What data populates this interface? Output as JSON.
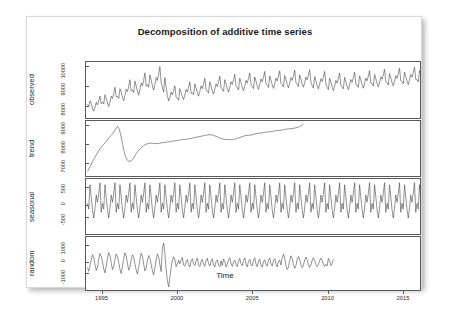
{
  "figure": {
    "title": "Decomposition of additive time series",
    "xlabel": "Time",
    "background_color": "#ffffff",
    "line_color": "#333333",
    "frame_color": "#5a5a5a"
  },
  "panels": {
    "observed": {
      "label": "observed",
      "yticks": [
        "10000",
        "9000",
        "8000"
      ]
    },
    "trend": {
      "label": "trend",
      "yticks": [
        "9000",
        "8000",
        "7000"
      ]
    },
    "seasonal": {
      "label": "seasonal",
      "yticks": [
        "500",
        "0",
        "-500"
      ]
    },
    "random": {
      "label": "random",
      "yticks": [
        "1000",
        "0",
        "-1000"
      ]
    }
  },
  "xaxis": {
    "ticks": [
      "1995",
      "2000",
      "2005",
      "2010",
      "2015"
    ],
    "range": [
      1993.9,
      2016.2
    ]
  },
  "chart_data": {
    "type": "line",
    "title": "Decomposition of additive time series",
    "xlabel": "Time",
    "ylabel": "",
    "grid": false,
    "legend": null,
    "layout": "4 stacked panels sharing one x axis (R decompose() additive model)",
    "x_start": 1994.0,
    "x_end": 2016.0,
    "frequency": 12,
    "series": [
      {
        "name": "observed",
        "panel": 1,
        "ylim": [
          7600,
          11400
        ],
        "yticks": [
          8000,
          9000,
          10000
        ],
        "values": [
          8450,
          8300,
          8700,
          8520,
          8180,
          7960,
          8250,
          8600,
          8420,
          8700,
          9050,
          8500,
          8620,
          8480,
          9150,
          8900,
          8550,
          8300,
          8620,
          9050,
          8880,
          9250,
          9700,
          9000,
          9050,
          8880,
          9600,
          9350,
          8980,
          8720,
          9100,
          9550,
          9380,
          9750,
          10250,
          9420,
          9500,
          9300,
          10150,
          9800,
          9400,
          9120,
          9520,
          10000,
          9800,
          10200,
          10750,
          9800,
          9900,
          9700,
          10600,
          10250,
          9800,
          9500,
          9900,
          10400,
          10200,
          10650,
          11200,
          10050,
          9700,
          9350,
          10400,
          9700,
          9100,
          8700,
          8950,
          9350,
          9150,
          9450,
          9800,
          8950,
          8900,
          8750,
          9600,
          9300,
          9000,
          8800,
          9150,
          9550,
          9350,
          9700,
          10100,
          9250,
          9300,
          9150,
          9950,
          9650,
          9300,
          9050,
          9400,
          9800,
          9600,
          9950,
          10350,
          9500,
          9450,
          9280,
          10100,
          9800,
          9450,
          9200,
          9550,
          9950,
          9750,
          10100,
          10500,
          9650,
          9550,
          9400,
          10250,
          9950,
          9600,
          9350,
          9700,
          10100,
          9900,
          10250,
          10650,
          9800,
          9700,
          9500,
          10350,
          10050,
          9700,
          9450,
          9800,
          10200,
          10000,
          10350,
          10750,
          9880,
          9780,
          9600,
          10450,
          10150,
          9800,
          9550,
          9900,
          10300,
          10100,
          10450,
          10850,
          9950,
          9850,
          9680,
          10520,
          10220,
          9870,
          9620,
          9960,
          10360,
          10160,
          10500,
          10900,
          10000,
          9900,
          9720,
          10560,
          10260,
          9910,
          9660,
          10000,
          10400,
          10200,
          10540,
          10940,
          10040,
          9930,
          9750,
          10600,
          10300,
          9950,
          9700,
          10040,
          10440,
          10240,
          10580,
          10980,
          10080,
          9820,
          9640,
          10480,
          10180,
          9830,
          9580,
          9920,
          10320,
          10120,
          10460,
          10860,
          9960,
          9700,
          9520,
          10360,
          10060,
          9710,
          9460,
          9800,
          10200,
          10000,
          10340,
          10740,
          9840,
          9760,
          9580,
          10420,
          10120,
          9770,
          9520,
          9860,
          10260,
          10060,
          10400,
          10800,
          9900,
          9860,
          9690,
          10530,
          10230,
          9880,
          9630,
          9970,
          10370,
          10170,
          10510,
          10910,
          10010,
          9960,
          9790,
          10630,
          10330,
          9980,
          9730,
          10070,
          10470,
          10270,
          10610,
          11010,
          10110,
          10030,
          9860,
          10700,
          10400,
          10050,
          9800,
          10140,
          10540,
          10340,
          10680,
          11080,
          10180,
          10120,
          9950,
          10790,
          10490,
          10140,
          9890,
          10230,
          10630,
          10430,
          10770,
          11170,
          10270,
          10250,
          10080,
          10920,
          10620,
          10270
        ]
      },
      {
        "name": "trend",
        "panel": 2,
        "ylim": [
          6700,
          9600
        ],
        "yticks": [
          7000,
          8000,
          9000
        ],
        "description": "Rises steeply from 1994 to a sharp peak in 1997, collapses to a deep trough in 1998, recovers gradually through 2000-2007, dips again 2008-2009, then climbs steadily with a sharp upturn at the end of the sample.",
        "values": [
          6850,
          6980,
          7120,
          7260,
          7400,
          7530,
          7650,
          7780,
          7900,
          8020,
          8130,
          8230,
          8320,
          8400,
          8470,
          8550,
          8640,
          8740,
          8830,
          8900,
          8980,
          9080,
          9200,
          9330,
          9400,
          9300,
          9100,
          8800,
          8450,
          8100,
          7800,
          7600,
          7480,
          7430,
          7420,
          7450,
          7520,
          7620,
          7740,
          7860,
          7960,
          8050,
          8130,
          8200,
          8260,
          8310,
          8350,
          8390,
          8420,
          8440,
          8450,
          8455,
          8450,
          8440,
          8430,
          8425,
          8430,
          8440,
          8455,
          8470,
          8485,
          8495,
          8500,
          8505,
          8515,
          8530,
          8545,
          8560,
          8570,
          8575,
          8580,
          8590,
          8600,
          8615,
          8630,
          8645,
          8655,
          8660,
          8665,
          8670,
          8680,
          8695,
          8710,
          8725,
          8740,
          8755,
          8770,
          8785,
          8800,
          8815,
          8830,
          8845,
          8860,
          8875,
          8890,
          8905,
          8920,
          8930,
          8935,
          8930,
          8915,
          8895,
          8870,
          8840,
          8805,
          8770,
          8740,
          8715,
          8695,
          8680,
          8670,
          8665,
          8660,
          8655,
          8650,
          8650,
          8655,
          8665,
          8680,
          8700,
          8725,
          8750,
          8775,
          8800,
          8825,
          8850,
          8870,
          8885,
          8895,
          8900,
          8905,
          8915,
          8930,
          8950,
          8970,
          8990,
          9005,
          9015,
          9020,
          9025,
          9035,
          9050,
          9065,
          9080,
          9090,
          9095,
          9100,
          9105,
          9115,
          9130,
          9145,
          9160,
          9170,
          9175,
          9180,
          9190,
          9200,
          9215,
          9230,
          9245,
          9255,
          9260,
          9265,
          9270,
          9280,
          9295,
          9310,
          9325,
          9340,
          9360,
          9390,
          9430,
          9480,
          9540
        ]
      },
      {
        "name": "seasonal",
        "panel": 3,
        "ylim": [
          -780,
          820
        ],
        "yticks": [
          -500,
          0,
          500
        ],
        "period": 12,
        "description": "Fixed annual seasonal profile repeated each year; strong positive peak with a secondary shoulder, deep negative trough.",
        "seasonal_profile": [
          120,
          -60,
          700,
          320,
          -80,
          -340,
          -30,
          380,
          150,
          430,
          760,
          -160
        ]
      },
      {
        "name": "random",
        "panel": 4,
        "ylim": [
          -1550,
          1450
        ],
        "yticks": [
          -1000,
          0,
          1000
        ],
        "description": "Large smooth oscillations 1994-1998 with a tall spike then a deep crash near 1998; thereafter higher-frequency lower-amplitude noise.",
        "values": [
          -300,
          -520,
          -180,
          160,
          480,
          320,
          -120,
          -480,
          -260,
          180,
          560,
          400,
          60,
          -380,
          -620,
          -200,
          280,
          620,
          440,
          0,
          -420,
          -240,
          200,
          520,
          360,
          20,
          -400,
          -660,
          -240,
          240,
          600,
          420,
          -40,
          -460,
          -280,
          160,
          480,
          340,
          -60,
          -440,
          -700,
          -280,
          200,
          580,
          400,
          -80,
          -500,
          -320,
          120,
          440,
          300,
          -100,
          -480,
          -740,
          -320,
          160,
          540,
          360,
          -120,
          -540,
          900,
          1200,
          560,
          -420,
          -1100,
          -1480,
          -900,
          -300,
          120,
          360,
          180,
          -240,
          -80,
          140,
          -60,
          180,
          320,
          -140,
          -220,
          60,
          180,
          -120,
          -260,
          100,
          240,
          -80,
          -180,
          120,
          280,
          -160,
          -240,
          80,
          200,
          -100,
          -220,
          140,
          260,
          -60,
          -200,
          100,
          240,
          -140,
          -260,
          60,
          180,
          -120,
          -240,
          120,
          -180,
          220,
          80,
          -260,
          -100,
          180,
          300,
          -80,
          -220,
          60,
          160,
          -140,
          -240,
          100,
          260,
          -60,
          -180,
          140,
          280,
          -100,
          -260,
          80,
          200,
          -120,
          -200,
          160,
          300,
          -80,
          -240,
          100,
          220,
          -140,
          -280,
          60,
          180,
          -100,
          -220,
          140,
          280,
          -60,
          -200,
          120,
          240,
          -100,
          -260,
          80,
          160,
          -140,
          320,
          520,
          280,
          -160,
          -420,
          -280,
          140,
          420,
          260,
          -120,
          -340,
          -180,
          200,
          380,
          180,
          -140,
          -300,
          -160,
          180,
          340,
          160,
          -120,
          -280,
          -140,
          160,
          300,
          140,
          -100,
          -240,
          -120,
          140,
          280,
          120,
          -80,
          -220,
          -100,
          -200,
          260,
          120,
          -180,
          -60,
          200
        ]
      }
    ]
  }
}
